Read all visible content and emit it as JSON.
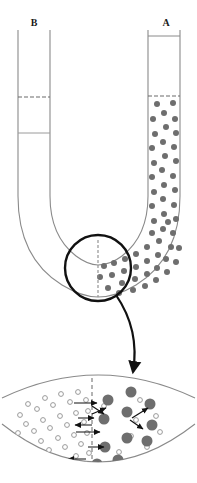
{
  "figure": {
    "labels": {
      "left_arm": "B",
      "right_arm": "A"
    },
    "colors": {
      "tube_outline": "#8a8a8a",
      "solute_particle": "#6e6e6e",
      "solvent_particle_stroke": "#9a9a9a",
      "membrane_dash": "#8a8a8a",
      "callout_circle": "#111111",
      "callout_arrow": "#111111",
      "background": "#ffffff",
      "label_text": "#1a1a1a"
    },
    "geometry": {
      "left_tube_x": [
        18,
        50
      ],
      "right_tube_x": [
        148,
        180
      ],
      "tube_top_y": 30,
      "right_cap_line_y": 36,
      "left_dashed_level_y": 97,
      "left_solid_level_y": 133,
      "right_dashed_level_y": 96,
      "membrane_x_detail": 92,
      "callout_circle_center": [
        98,
        268
      ],
      "callout_circle_radius": 33
    },
    "elements": {
      "left_fluid_dashed_level": "dashed level line in arm B",
      "left_fluid_solid_level": "solid level line in arm B",
      "right_fluid_dashed_level": "dashed level line in arm A",
      "solute_region": "right arm and bend filled with gray solute particles",
      "membrane": "vertical dashed semipermeable membrane at U-bend",
      "callout_circle": "circle highlighting the membrane region",
      "callout_arrow": "curved arrow from circle to magnified view",
      "magnified_view": "enlarged band showing solvent and solute particles with motion arrows"
    },
    "magnified": {
      "description": "Magnified membrane region: small open circles (solvent) on the left side, large filled circles (solute) on the right side, dashed membrane between them, straight arrows indicating particle motion across and away from the membrane.",
      "solvent_particle_count": 34,
      "solute_particle_count": 11,
      "arrow_count": 11,
      "membrane_type": "semipermeable",
      "arc_top_label": "outer wall arc",
      "arc_bottom_label": "inner wall arc"
    },
    "particles": {
      "solute_radius_tube": 3.0,
      "solute_radius_detail": 5.5,
      "solvent_radius_detail": 2.4
    }
  }
}
